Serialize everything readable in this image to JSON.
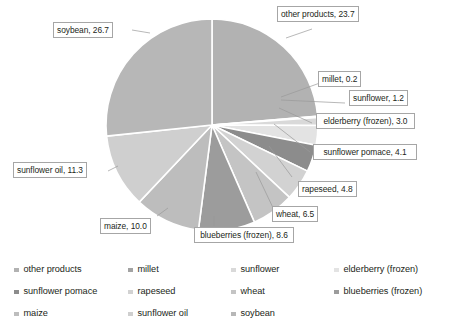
{
  "chart_data": {
    "type": "pie",
    "title": "",
    "subtitle": "",
    "xlabel": "",
    "ylabel": "",
    "grid": false,
    "legend_position": "bottom",
    "value_unit": "percent",
    "total": 100.1,
    "categories": [
      "other products",
      "millet",
      "sunflower",
      "elderberry (frozen)",
      "sunflower pomace",
      "rapeseed",
      "wheat",
      "blueberries (frozen)",
      "maize",
      "sunflower oil",
      "soybean"
    ],
    "values": [
      23.7,
      0.2,
      1.2,
      3.0,
      4.1,
      4.8,
      6.5,
      8.6,
      10.0,
      11.3,
      26.7
    ],
    "colors": [
      "#b2b2b2",
      "#a3a3a3",
      "#d9d9d9",
      "#e3e3e3",
      "#8c8c8c",
      "#d2d2d2",
      "#c4c4c4",
      "#9c9c9c",
      "#bdbdbd",
      "#cfcfcf",
      "#b7b7b7"
    ],
    "slice_labels": [
      "other products, 23.7",
      "millet, 0.2",
      "sunflower, 1.2",
      "elderberry (frozen), 3.0",
      "sunflower pomace, 4.1",
      "rapeseed, 4.8",
      "wheat, 6.5",
      "blueberries (frozen), 8.6",
      "maize, 10.0",
      "sunflower oil, 11.3",
      "soybean, 26.7"
    ]
  },
  "callouts": {
    "other_products": "other products, 23.7",
    "millet": "millet, 0.2",
    "sunflower": "sunflower, 1.2",
    "elderberry_frozen": "elderberry (frozen), 3.0",
    "sunflower_pomace": "sunflower pomace, 4.1",
    "rapeseed": "rapeseed, 4.8",
    "wheat": "wheat, 6.5",
    "blueberries_frozen": "blueberries (frozen), 8.6",
    "maize": "maize, 10.0",
    "sunflower_oil": "sunflower oil, 11.3",
    "soybean": "soybean, 26.7"
  },
  "legend": {
    "items": [
      {
        "label": "other products",
        "color": "#b2b2b2"
      },
      {
        "label": "millet",
        "color": "#a3a3a3"
      },
      {
        "label": "sunflower",
        "color": "#d9d9d9"
      },
      {
        "label": "elderberry (frozen)",
        "color": "#e3e3e3"
      },
      {
        "label": "sunflower pomace",
        "color": "#8c8c8c"
      },
      {
        "label": "rapeseed",
        "color": "#d2d2d2"
      },
      {
        "label": "wheat",
        "color": "#c4c4c4"
      },
      {
        "label": "blueberries (frozen)",
        "color": "#9c9c9c"
      },
      {
        "label": "maize",
        "color": "#bdbdbd"
      },
      {
        "label": "sunflower oil",
        "color": "#cfcfcf"
      },
      {
        "label": "soybean",
        "color": "#b7b7b7"
      }
    ]
  }
}
